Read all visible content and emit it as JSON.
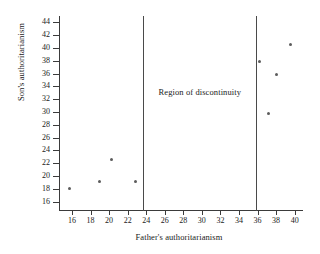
{
  "chart_data": {
    "type": "scatter",
    "title": "",
    "xlabel": "Father's authoritarianism",
    "ylabel": "Son's authoritarianism",
    "xlim": [
      14.6,
      40.9
    ],
    "ylim": [
      14.7,
      45.0
    ],
    "grid": false,
    "legend": null,
    "xticks": [
      16,
      18,
      20,
      22,
      24,
      26,
      28,
      30,
      32,
      34,
      36,
      38,
      40
    ],
    "yticks": [
      16,
      18,
      20,
      22,
      24,
      26,
      28,
      30,
      32,
      34,
      36,
      38,
      40,
      42,
      44
    ],
    "points": [
      {
        "x": 15.7,
        "y": 18.1
      },
      {
        "x": 19.0,
        "y": 19.2
      },
      {
        "x": 20.3,
        "y": 22.6
      },
      {
        "x": 22.8,
        "y": 19.1
      },
      {
        "x": 36.2,
        "y": 37.9
      },
      {
        "x": 37.2,
        "y": 29.7
      },
      {
        "x": 38.0,
        "y": 35.9
      },
      {
        "x": 39.6,
        "y": 40.6
      }
    ],
    "annotations": [
      {
        "text": "Region of discontinuity",
        "x": 29.8,
        "y": 33.1
      }
    ],
    "vlines": [
      23.7,
      35.8
    ],
    "marker_color": "#5c5c5c",
    "axis_color": "#3b3b3b"
  }
}
